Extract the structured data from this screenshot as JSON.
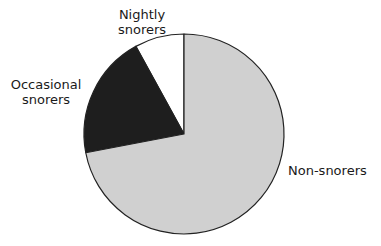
{
  "chart_data": {
    "type": "pie",
    "title": "",
    "categories": [
      "Non-snorers",
      "Occasional snorers",
      "Nightly snorers"
    ],
    "values": [
      72,
      20,
      8
    ],
    "unit": "percent (estimated)",
    "colors": [
      "#d0d0d0",
      "#1e1e1e",
      "#ffffff"
    ],
    "start_angle": "12 o'clock",
    "direction": "counterclockwise for Nightly then Occasional; Non-snorers fills remainder",
    "legend": "none (direct labels)"
  },
  "labels": {
    "nightly_line1": "Nightly",
    "nightly_line2": "snorers",
    "occasional_line1": "Occasional",
    "occasional_line2": "snorers",
    "non": "Non-snorers"
  },
  "geometry": {
    "cx": 184,
    "cy": 134,
    "r": 100
  }
}
